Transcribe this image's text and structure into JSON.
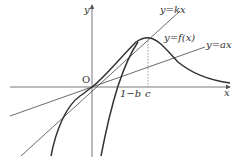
{
  "diagram": {
    "axes": {
      "x_label": "x",
      "y_label": "y",
      "origin_label": "O"
    },
    "curves": [
      {
        "id": "f",
        "label": "y=f(x)"
      },
      {
        "id": "kx",
        "label": "y=kx"
      },
      {
        "id": "ax",
        "label": "y=ax"
      }
    ],
    "ticks": [
      {
        "id": "one_minus_b",
        "label": "1−b"
      },
      {
        "id": "c",
        "label": "c"
      }
    ],
    "colors": {
      "curve": "#333333",
      "line": "#444444",
      "axis": "#555555",
      "dashed": "#777777"
    }
  }
}
